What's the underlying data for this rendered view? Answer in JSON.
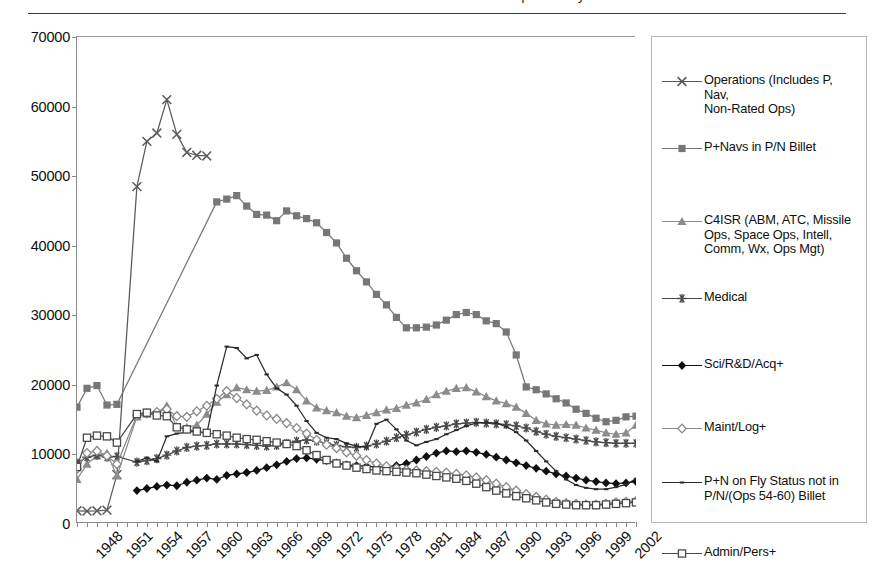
{
  "page": {
    "cut_off_title": "Officer Rated and Non-Rated Career Field Population by Year"
  },
  "chart_data": {
    "type": "line",
    "title": "",
    "xlabel": "",
    "ylabel": "",
    "grid": false,
    "legend_position": "right",
    "xlim": [
      1948,
      2004
    ],
    "ylim": [
      0,
      70000
    ],
    "ytick_labels": [
      "0",
      "10000",
      "20000",
      "30000",
      "40000",
      "50000",
      "60000",
      "70000"
    ],
    "ytick_values": [
      0,
      10000,
      20000,
      30000,
      40000,
      50000,
      60000,
      70000
    ],
    "xtick_labels": [
      "1948",
      "1951",
      "1954",
      "1957",
      "1960",
      "1963",
      "1966",
      "1969",
      "1972",
      "1975",
      "1978",
      "1981",
      "1984",
      "1987",
      "1990",
      "1993",
      "1996",
      "1999",
      "2002"
    ],
    "xtick_values": [
      1948,
      1951,
      1954,
      1957,
      1960,
      1963,
      1966,
      1969,
      1972,
      1975,
      1978,
      1981,
      1984,
      1987,
      1990,
      1993,
      1996,
      1999,
      2002
    ],
    "series": [
      {
        "name": "Operations (Includes P, Nav,\nNon-Rated Ops)",
        "marker": "x-cross",
        "color": "#5a5a5a",
        "x": [
          1948,
          1949,
          1950,
          1951,
          1952,
          1954,
          1955,
          1956,
          1957,
          1958,
          1959,
          1960,
          1961
        ],
        "values": [
          1900,
          1850,
          1900,
          2000,
          7100,
          48500,
          55000,
          56200,
          61000,
          56000,
          53400,
          53000,
          52900
        ]
      },
      {
        "name": "P+Navs in P/N Billet",
        "marker": "filled-square",
        "color": "#777777",
        "x": [
          1948,
          1949,
          1950,
          1951,
          1952,
          1962,
          1963,
          1964,
          1965,
          1966,
          1967,
          1968,
          1969,
          1970,
          1971,
          1972,
          1973,
          1974,
          1975,
          1976,
          1977,
          1978,
          1979,
          1980,
          1981,
          1982,
          1983,
          1984,
          1985,
          1986,
          1987,
          1988,
          1989,
          1990,
          1991,
          1992,
          1993,
          1994,
          1995,
          1996,
          1997,
          1998,
          1999,
          2000,
          2001,
          2002,
          2003,
          2004
        ],
        "values": [
          16800,
          19500,
          19900,
          17100,
          17200,
          46300,
          46700,
          47200,
          45700,
          44500,
          44400,
          43600,
          45000,
          44300,
          43900,
          43300,
          41900,
          40400,
          38200,
          36400,
          34800,
          33000,
          31500,
          29700,
          28200,
          28200,
          28300,
          28600,
          29300,
          30100,
          30400,
          30100,
          29200,
          28800,
          27600,
          24300,
          19700,
          19300,
          18700,
          18000,
          17400,
          16500,
          15900,
          15200,
          14700,
          14900,
          15400,
          15500
        ]
      },
      {
        "name": "C4ISR (ABM, ATC, Missile\nOps, Space Ops, Intell,\nComm, Wx, Ops Mgt)",
        "marker": "filled-triangle",
        "color": "#8c8c8c",
        "x": [
          1948,
          1949,
          1950,
          1951,
          1952,
          1954,
          1955,
          1956,
          1957,
          1958,
          1959,
          1960,
          1961,
          1962,
          1963,
          1964,
          1965,
          1966,
          1967,
          1968,
          1969,
          1970,
          1971,
          1972,
          1973,
          1974,
          1975,
          1976,
          1977,
          1978,
          1979,
          1980,
          1981,
          1982,
          1983,
          1984,
          1985,
          1986,
          1987,
          1988,
          1989,
          1990,
          1991,
          1992,
          1993,
          1994,
          1995,
          1996,
          1997,
          1998,
          1999,
          2000,
          2001,
          2002,
          2003,
          2004
        ],
        "values": [
          6400,
          8600,
          9800,
          10200,
          6900,
          15400,
          15800,
          16000,
          17000,
          14000,
          13900,
          14200,
          15800,
          17500,
          18600,
          19600,
          19300,
          19100,
          19200,
          19700,
          20300,
          19300,
          17700,
          16700,
          16300,
          16000,
          15500,
          15300,
          15600,
          16000,
          16400,
          16600,
          17100,
          17400,
          17900,
          18600,
          19100,
          19500,
          19600,
          19000,
          18300,
          17700,
          17300,
          16800,
          15900,
          14900,
          14400,
          14200,
          14300,
          14200,
          13800,
          13500,
          13100,
          12900,
          13100,
          14200
        ]
      },
      {
        "name": "Medical",
        "marker": "star6",
        "color": "#4a4a4a",
        "x": [
          1948,
          1949,
          1950,
          1951,
          1952,
          1954,
          1955,
          1956,
          1957,
          1958,
          1959,
          1960,
          1961,
          1962,
          1963,
          1964,
          1965,
          1966,
          1967,
          1968,
          1969,
          1970,
          1971,
          1972,
          1973,
          1974,
          1975,
          1976,
          1977,
          1978,
          1979,
          1980,
          1981,
          1982,
          1983,
          1984,
          1985,
          1986,
          1987,
          1988,
          1989,
          1990,
          1991,
          1992,
          1993,
          1994,
          1995,
          1996,
          1997,
          1998,
          1999,
          2000,
          2001,
          2002,
          2003,
          2004
        ],
        "values": [
          8800,
          9600,
          9900,
          9600,
          9700,
          8900,
          9100,
          9400,
          9900,
          10500,
          11000,
          11200,
          11300,
          11500,
          11500,
          11500,
          11400,
          11300,
          11200,
          11300,
          11600,
          11900,
          12100,
          11900,
          11600,
          11300,
          11100,
          11000,
          11200,
          11500,
          11900,
          12400,
          12800,
          13200,
          13600,
          13900,
          14100,
          14400,
          14500,
          14600,
          14500,
          14400,
          14300,
          14100,
          13800,
          13300,
          12900,
          12600,
          12400,
          12200,
          12000,
          11800,
          11700,
          11600,
          11600,
          11600
        ]
      },
      {
        "name": "Sci/R&D/Acq+",
        "marker": "filled-diamond",
        "color": "#101010",
        "x": [
          1954,
          1955,
          1956,
          1957,
          1958,
          1959,
          1960,
          1961,
          1962,
          1963,
          1964,
          1965,
          1966,
          1967,
          1968,
          1969,
          1970,
          1971,
          1972,
          1973,
          1974,
          1975,
          1976,
          1977,
          1978,
          1979,
          1980,
          1981,
          1982,
          1983,
          1984,
          1985,
          1986,
          1987,
          1988,
          1989,
          1990,
          1991,
          1992,
          1993,
          1994,
          1995,
          1996,
          1997,
          1998,
          1999,
          2000,
          2001,
          2002,
          2003,
          2004
        ],
        "values": [
          4800,
          5100,
          5400,
          5600,
          5500,
          6000,
          6300,
          6600,
          6400,
          7000,
          7200,
          7400,
          7700,
          8100,
          8500,
          9000,
          9400,
          9500,
          9300,
          9100,
          8800,
          8500,
          8400,
          8300,
          8200,
          8200,
          8400,
          8700,
          9200,
          9700,
          10200,
          10500,
          10400,
          10500,
          10300,
          10000,
          9600,
          9200,
          8800,
          8400,
          8000,
          7600,
          7200,
          6900,
          6600,
          6300,
          6100,
          5900,
          5800,
          5900,
          6100
        ]
      },
      {
        "name": "Maint/Log+",
        "marker": "open-diamond",
        "color": "#8a8a8a",
        "x": [
          1948,
          1949,
          1950,
          1951,
          1952,
          1954,
          1955,
          1956,
          1957,
          1958,
          1959,
          1960,
          1961,
          1962,
          1963,
          1964,
          1965,
          1966,
          1967,
          1968,
          1969,
          1970,
          1971,
          1972,
          1973,
          1974,
          1975,
          1976,
          1977,
          1978,
          1979,
          1980,
          1981,
          1982,
          1983,
          1984,
          1985,
          1986,
          1987,
          1988,
          1989,
          1990,
          1991,
          1992,
          1993,
          1994,
          1995,
          1996,
          1997,
          1998,
          1999,
          2000,
          2001,
          2002,
          2003,
          2004
        ],
        "values": [
          7900,
          10200,
          10500,
          9800,
          8600,
          15600,
          15900,
          16100,
          16500,
          15500,
          15400,
          16200,
          17000,
          18000,
          19100,
          18100,
          17200,
          16300,
          15600,
          15100,
          14500,
          13800,
          13000,
          12100,
          11400,
          10900,
          10300,
          9800,
          9200,
          8700,
          8300,
          8000,
          7800,
          7700,
          7600,
          7500,
          7400,
          7200,
          7000,
          6700,
          6300,
          5800,
          5300,
          4800,
          4300,
          3900,
          3500,
          3200,
          3000,
          2900,
          2800,
          2800,
          2900,
          3100,
          3200,
          3300
        ]
      },
      {
        "name": "P+N on Fly Status not in\nP/N/(Ops 54-60) Billet",
        "marker": "tiny-dash",
        "color": "#2b2b2b",
        "x": [
          1954,
          1955,
          1956,
          1957,
          1958,
          1959,
          1960,
          1961,
          1962,
          1963,
          1964,
          1965,
          1966,
          1967,
          1968,
          1969,
          1970,
          1971,
          1972,
          1973,
          1974,
          1975,
          1976,
          1977,
          1978,
          1979,
          1980,
          1981,
          1982,
          1983,
          1984,
          1985,
          1986,
          1987,
          1988,
          1989,
          1990,
          1991,
          1992,
          1993,
          1994,
          1995,
          1996,
          1997,
          1998,
          1999,
          2000,
          2001,
          2002,
          2003,
          2004
        ],
        "values": [
          9000,
          9500,
          9000,
          12600,
          13000,
          13200,
          13300,
          13000,
          19900,
          25500,
          25300,
          23800,
          24300,
          21500,
          19500,
          18600,
          17000,
          14800,
          13100,
          12400,
          12200,
          11600,
          11200,
          11000,
          14400,
          15000,
          13600,
          12000,
          11300,
          11800,
          12200,
          12900,
          13500,
          14100,
          14500,
          14600,
          14500,
          14000,
          13200,
          12000,
          10500,
          9000,
          7600,
          6400,
          5600,
          5200,
          5000,
          5000,
          5300,
          5700,
          6500
        ]
      },
      {
        "name": "Admin/Pers+",
        "marker": "open-square",
        "color": "#4a4a4a",
        "x": [
          1948,
          1949,
          1950,
          1951,
          1952,
          1954,
          1955,
          1956,
          1957,
          1958,
          1959,
          1960,
          1961,
          1962,
          1963,
          1964,
          1965,
          1966,
          1967,
          1968,
          1969,
          1970,
          1971,
          1972,
          1973,
          1974,
          1975,
          1976,
          1977,
          1978,
          1979,
          1980,
          1981,
          1982,
          1983,
          1984,
          1985,
          1986,
          1987,
          1988,
          1989,
          1990,
          1991,
          1992,
          1993,
          1994,
          1995,
          1996,
          1997,
          1998,
          1999,
          2000,
          2001,
          2002,
          2003,
          2004
        ],
        "values": [
          8200,
          12400,
          12700,
          12600,
          11700,
          15800,
          16000,
          15600,
          15500,
          13900,
          13600,
          13300,
          13100,
          12900,
          12700,
          12400,
          12200,
          12100,
          11900,
          11700,
          11500,
          11200,
          10600,
          9900,
          9200,
          8700,
          8400,
          8100,
          7900,
          7700,
          7600,
          7500,
          7400,
          7300,
          7100,
          6900,
          6700,
          6500,
          6200,
          5800,
          5300,
          4800,
          4400,
          4000,
          3700,
          3400,
          3100,
          2900,
          2800,
          2700,
          2700,
          2700,
          2800,
          2900,
          3000,
          3100
        ]
      }
    ]
  },
  "legend": {
    "items": [
      {
        "label": "Operations (Includes P, Nav,\nNon-Rated Ops)",
        "marker": "x-cross",
        "top": 36
      },
      {
        "label": "P+Navs in P/N Billet",
        "marker": "filled-square",
        "top": 103
      },
      {
        "label": "C4ISR (ABM, ATC, Missile\nOps, Space Ops, Intell,\nComm, Wx, Ops Mgt)",
        "marker": "filled-triangle",
        "top": 176
      },
      {
        "label": "Medical",
        "marker": "star6",
        "top": 253
      },
      {
        "label": "Sci/R&D/Acq+",
        "marker": "filled-diamond",
        "top": 320
      },
      {
        "label": "Maint/Log+",
        "marker": "open-diamond",
        "top": 383
      },
      {
        "label": "P+N on Fly Status not in\nP/N/(Ops 54-60) Billet",
        "marker": "tiny-dash",
        "top": 437
      },
      {
        "label": "Admin/Pers+",
        "marker": "open-square",
        "top": 508
      }
    ]
  }
}
